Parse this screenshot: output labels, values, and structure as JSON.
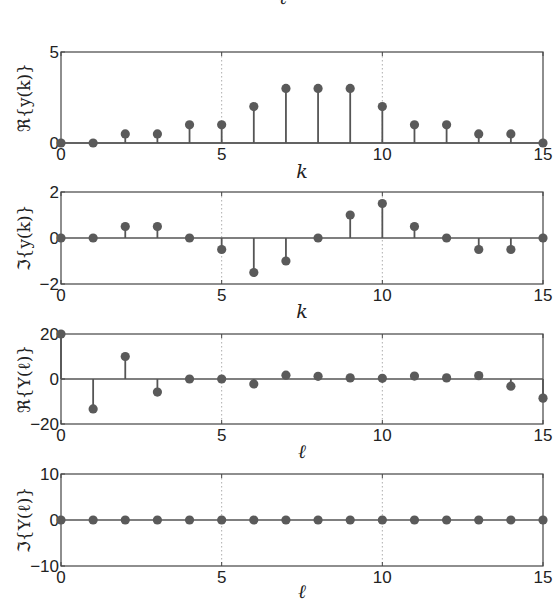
{
  "top_cropped_label": "ℓ",
  "chart_data": [
    {
      "type": "stem",
      "title": "",
      "xlabel": "k",
      "ylabel": "ℜ{y(k)}",
      "xlim": [
        0,
        15
      ],
      "ylim": [
        0,
        5
      ],
      "xticks": [
        0,
        5,
        10,
        15
      ],
      "yticks": [
        0,
        5
      ],
      "grid": "dotted vertical at x=5,10",
      "x": [
        0,
        1,
        2,
        3,
        4,
        5,
        6,
        7,
        8,
        9,
        10,
        11,
        12,
        13,
        14,
        15
      ],
      "values": [
        0,
        0,
        0.5,
        0.5,
        1,
        1,
        2,
        3,
        3,
        3,
        2,
        1,
        1,
        0.5,
        0.5,
        0
      ]
    },
    {
      "type": "stem",
      "title": "",
      "xlabel": "k",
      "ylabel": "ℑ{y(k)}",
      "xlim": [
        0,
        15
      ],
      "ylim": [
        -2,
        2
      ],
      "xticks": [
        0,
        5,
        10,
        15
      ],
      "yticks": [
        -2,
        0,
        2
      ],
      "grid": "dotted vertical at x=5,10",
      "x": [
        0,
        1,
        2,
        3,
        4,
        5,
        6,
        7,
        8,
        9,
        10,
        11,
        12,
        13,
        14,
        15
      ],
      "values": [
        0,
        0,
        0.5,
        0.5,
        0,
        -0.5,
        -1.5,
        -1,
        0,
        1,
        1.5,
        0.5,
        0,
        -0.5,
        -0.5,
        0
      ]
    },
    {
      "type": "stem",
      "title": "",
      "xlabel": "ℓ",
      "ylabel": "ℜ{Y(ℓ)}",
      "xlim": [
        0,
        15
      ],
      "ylim": [
        -20,
        20
      ],
      "xticks": [
        0,
        5,
        10,
        15
      ],
      "yticks": [
        -20,
        0,
        20
      ],
      "grid": "dotted vertical at x=5,10",
      "x": [
        0,
        1,
        2,
        3,
        4,
        5,
        6,
        7,
        8,
        9,
        10,
        11,
        12,
        13,
        14,
        15
      ],
      "values": [
        20,
        -13.3,
        10,
        -5.8,
        0,
        0,
        -2.2,
        1.7,
        1.2,
        0.5,
        0.3,
        1.3,
        0.5,
        1.5,
        -3.2,
        -8.5
      ]
    },
    {
      "type": "stem",
      "title": "",
      "xlabel": "ℓ",
      "ylabel": "ℑ{Y(ℓ)}",
      "xlim": [
        0,
        15
      ],
      "ylim": [
        -10,
        10
      ],
      "xticks": [
        0,
        5,
        10,
        15
      ],
      "yticks": [
        -10,
        0,
        10
      ],
      "grid": "dotted vertical at x=5,10",
      "x": [
        0,
        1,
        2,
        3,
        4,
        5,
        6,
        7,
        8,
        9,
        10,
        11,
        12,
        13,
        14,
        15
      ],
      "values": [
        0,
        0,
        0,
        0,
        0,
        0,
        0,
        0,
        0,
        0,
        0,
        0,
        0,
        0,
        0,
        0
      ]
    }
  ],
  "style": {
    "axis_color": "#444444",
    "stem_color": "#555555",
    "marker_color": "#5a5a5a",
    "grid_color": "#999999"
  }
}
